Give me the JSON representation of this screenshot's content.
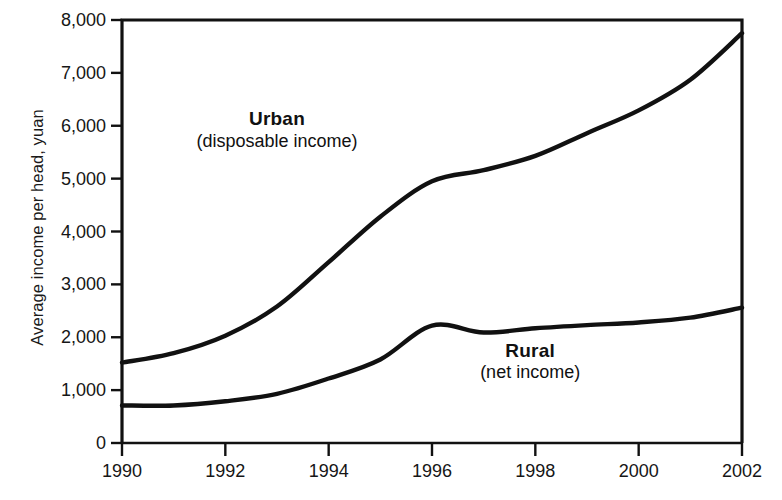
{
  "chart_data": {
    "type": "line",
    "title": "",
    "subtitle": "",
    "xlabel": "",
    "ylabel": "Average income per head, yuan",
    "xlim": [
      1990,
      2002
    ],
    "ylim": [
      0,
      8000
    ],
    "grid": false,
    "legend_position": "inline-annotations",
    "x": [
      1990,
      1991,
      1992,
      1993,
      1994,
      1995,
      1996,
      1997,
      1998,
      1999,
      2000,
      2001,
      2002
    ],
    "x_tick_labels": [
      "1990",
      "1992",
      "1994",
      "1996",
      "1998",
      "2000",
      "2002"
    ],
    "x_tick_values": [
      1990,
      1992,
      1994,
      1996,
      1998,
      2000,
      2002
    ],
    "y_tick_labels": [
      "0",
      "1,000",
      "2,000",
      "3,000",
      "4,000",
      "5,000",
      "6,000",
      "7,000",
      "8,000"
    ],
    "y_tick_values": [
      0,
      1000,
      2000,
      3000,
      4000,
      5000,
      6000,
      7000,
      8000
    ],
    "series": [
      {
        "name": "Urban",
        "sublabel": "(disposable income)",
        "color": "#111111",
        "values": [
          1520,
          1700,
          2030,
          2580,
          3420,
          4280,
          4950,
          5160,
          5430,
          5860,
          6290,
          6870,
          7750
        ]
      },
      {
        "name": "Rural",
        "sublabel": "(net income)",
        "color": "#111111",
        "values": [
          710,
          710,
          790,
          930,
          1220,
          1580,
          2220,
          2090,
          2170,
          2230,
          2280,
          2370,
          2560
        ]
      }
    ],
    "annotations": [
      {
        "text": "Urban",
        "subtext": "(disposable income)",
        "x": 1993.0,
        "y": 6100
      },
      {
        "text": "Rural",
        "subtext": "(net income)",
        "x": 1997.9,
        "y": 1720
      }
    ]
  },
  "axis_line_color": "#111111",
  "background_color": "#ffffff"
}
